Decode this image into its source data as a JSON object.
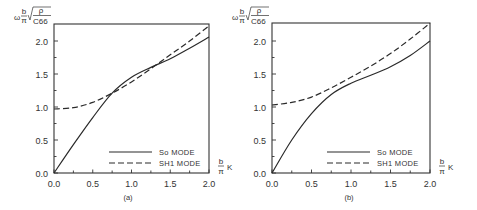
{
  "chart_data": [
    {
      "type": "line",
      "panel_label": "(a)",
      "xlabel": "b/π K",
      "ylabel": "ω b/π √(ρ/C66)",
      "xlim": [
        0.0,
        2.0
      ],
      "ylim": [
        0.0,
        2.25
      ],
      "x_ticks": [
        "0.0",
        "0.5",
        "1.0",
        "1.5",
        "2.0"
      ],
      "y_ticks": [
        "0.0",
        "0.5",
        "1.0",
        "1.5",
        "2.0"
      ],
      "grid": false,
      "legend_position": "lower right",
      "series": [
        {
          "name": "So MODE",
          "style": "solid",
          "x": [
            0.0,
            0.25,
            0.5,
            0.75,
            1.0,
            1.25,
            1.5,
            1.75,
            2.0
          ],
          "y": [
            0.0,
            0.43,
            0.84,
            1.21,
            1.45,
            1.6,
            1.73,
            1.89,
            2.06
          ]
        },
        {
          "name": "SH1 MODE",
          "style": "dashed",
          "x": [
            0.0,
            0.25,
            0.5,
            0.75,
            1.0,
            1.25,
            1.5,
            1.75,
            2.0
          ],
          "y": [
            0.97,
            0.99,
            1.07,
            1.21,
            1.38,
            1.58,
            1.79,
            2.0,
            2.23
          ]
        }
      ]
    },
    {
      "type": "line",
      "panel_label": "(b)",
      "xlabel": "b/π K",
      "ylabel": "ω b/π √(ρ/C66)",
      "xlim": [
        0.0,
        2.0
      ],
      "ylim": [
        0.0,
        2.25
      ],
      "x_ticks": [
        "0.0",
        "0.5",
        "1.0",
        "1.5",
        "2.0"
      ],
      "y_ticks": [
        "0.0",
        "0.5",
        "1.0",
        "1.5",
        "2.0"
      ],
      "grid": false,
      "legend_position": "lower right",
      "series": [
        {
          "name": "So MODE",
          "style": "solid",
          "x": [
            0.0,
            0.25,
            0.5,
            0.75,
            1.0,
            1.25,
            1.5,
            1.75,
            2.0
          ],
          "y": [
            0.0,
            0.5,
            0.9,
            1.19,
            1.36,
            1.48,
            1.61,
            1.78,
            2.0
          ]
        },
        {
          "name": "SH1 MODE",
          "style": "dashed",
          "x": [
            0.0,
            0.25,
            0.5,
            0.75,
            1.0,
            1.25,
            1.5,
            1.75,
            2.0
          ],
          "y": [
            1.03,
            1.07,
            1.15,
            1.29,
            1.45,
            1.62,
            1.81,
            2.03,
            2.27
          ]
        }
      ]
    }
  ],
  "labels": {
    "ylabel_omega": "ω",
    "ylabel_b": "b",
    "ylabel_pi": "π",
    "ylabel_rho": "ρ",
    "ylabel_c66": "C66",
    "xlabel_b": "b",
    "xlabel_pi": "π",
    "xlabel_k": "K",
    "legend_so": "So MODE",
    "legend_sh1": "SH1 MODE",
    "caption_a": "(a)",
    "caption_b": "(b)"
  }
}
